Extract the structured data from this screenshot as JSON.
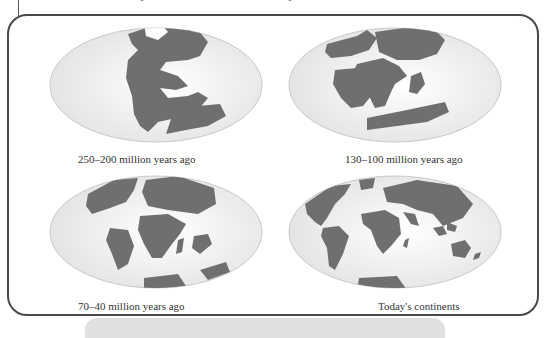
{
  "figure": {
    "panels": [
      {
        "id": "p1",
        "caption": "250–200 million years ago",
        "map": "pangaea-map"
      },
      {
        "id": "p2",
        "caption": "130–100 million years ago",
        "map": "laurasia-gondwana-map"
      },
      {
        "id": "p3",
        "caption": "70–40 million years ago",
        "map": "breakup-map"
      },
      {
        "id": "p4",
        "caption": "Today's continents",
        "map": "modern-world-map"
      }
    ],
    "colors": {
      "land": "#6f6f6f",
      "ocean": "#ececec",
      "ocean_edge": "#c9c9c9",
      "frame": "#4a4a4a",
      "caption_bar": "#e0e0e0"
    }
  }
}
